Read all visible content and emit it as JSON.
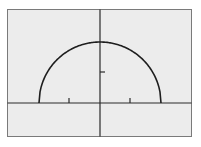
{
  "chart_data": {
    "type": "line",
    "title": "",
    "xlabel": "",
    "ylabel": "",
    "function": "y = sqrt(4 - x^2)",
    "series": [
      {
        "name": "semicircle",
        "x": [
          -2,
          -1.5,
          -1,
          -0.5,
          0,
          0.5,
          1,
          1.5,
          2
        ],
        "values": [
          0,
          1.32,
          1.73,
          1.94,
          2,
          1.94,
          1.73,
          1.32,
          0
        ]
      }
    ],
    "xlim": [
      -3.3,
      3.0
    ],
    "ylim": [
      -1.1,
      3.1
    ],
    "x_ticks": [
      -1,
      1
    ],
    "y_ticks": [
      1
    ],
    "grid": false,
    "legend": "none"
  },
  "colors": {
    "background": "#ececec",
    "frame": "#7a7a7a",
    "axes": "#2a2a2a",
    "curve": "#1e1e1e"
  }
}
